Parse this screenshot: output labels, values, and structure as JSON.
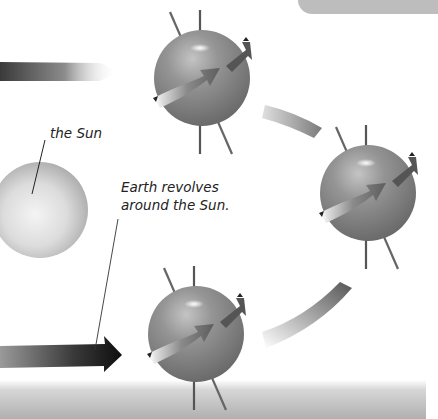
{
  "diagram": {
    "labels": {
      "sun": "the Sun",
      "earth_line1": "Earth revolves",
      "earth_line2": "around the Sun."
    },
    "elements": {
      "sun": {
        "cx": 40,
        "cy": 210,
        "r": 48
      },
      "earths": [
        {
          "position": "top",
          "cx": 202,
          "cy": 78,
          "r": 48
        },
        {
          "position": "right",
          "cx": 368,
          "cy": 193,
          "r": 48
        },
        {
          "position": "bottom",
          "cx": 196,
          "cy": 334,
          "r": 48
        }
      ]
    },
    "colors": {
      "background": "#ffffff",
      "sphere_dark": "#5e5e5e",
      "sphere_mid": "#8a8a8a",
      "sphere_light": "#c8c8c8",
      "arrow_dark": "#2a2a2a",
      "bottom_band": "#b8b8b8",
      "top_box": "#bdbdbd"
    }
  }
}
